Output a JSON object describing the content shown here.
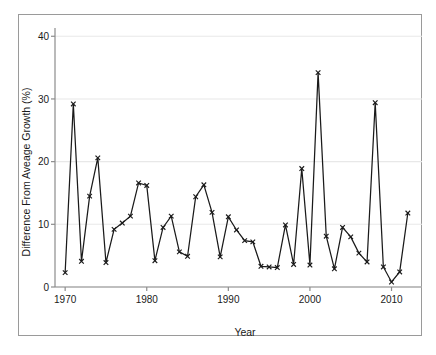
{
  "chart_data": {
    "type": "line",
    "title": "",
    "xlabel": "Year",
    "ylabel": "Difference From Aveage Growth (%)",
    "xlim": [
      1969,
      2013
    ],
    "ylim": [
      0,
      41
    ],
    "xticks": [
      1970,
      1980,
      1990,
      2000,
      2010
    ],
    "xtick_labels": [
      "1970",
      "1980",
      "1990",
      "2000",
      "2010"
    ],
    "yticks": [
      0,
      10,
      20,
      30,
      40
    ],
    "ytick_labels": [
      "0",
      "10",
      "20",
      "30",
      "40"
    ],
    "grid": "horizontal",
    "legend": "none",
    "marker": "x",
    "line_color": "#1a1a1a",
    "marker_color": "#1a1a1a",
    "grid_color": "#e8e8e8",
    "frame_color": "#9a9a9a",
    "x": [
      1970,
      1971,
      1972,
      1973,
      1974,
      1975,
      1976,
      1977,
      1978,
      1979,
      1980,
      1981,
      1982,
      1983,
      1984,
      1985,
      1986,
      1987,
      1988,
      1989,
      1990,
      1991,
      1992,
      1993,
      1994,
      1995,
      1996,
      1997,
      1998,
      1999,
      2000,
      2001,
      2002,
      2003,
      2004,
      2005,
      2006,
      2007,
      2008,
      2009,
      2010,
      2011,
      2012
    ],
    "values": [
      2.3,
      29.2,
      4.1,
      14.5,
      20.6,
      3.9,
      9.2,
      10.2,
      11.3,
      16.6,
      16.2,
      4.2,
      9.5,
      11.3,
      5.6,
      4.9,
      14.4,
      16.3,
      11.9,
      4.8,
      11.2,
      9.1,
      7.4,
      7.2,
      3.3,
      3.2,
      3.1,
      9.9,
      3.6,
      18.9,
      3.5,
      34.2,
      8.1,
      2.9,
      9.5,
      8.0,
      5.4,
      4.0,
      29.4,
      3.2,
      0.8,
      2.4,
      11.8
    ]
  }
}
